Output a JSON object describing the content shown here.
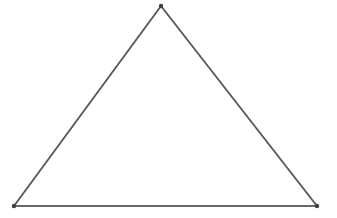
{
  "figure": {
    "kind": "geometry-diagram",
    "shape_name": "triangle",
    "caption": "",
    "background_color": "#ffffff",
    "canvas": {
      "width": 337,
      "height": 218
    },
    "stroke": {
      "color": "#5a5a5a",
      "width": 1.5,
      "opacity": 0.92
    },
    "vertex_marker": {
      "color": "#3f3f3f",
      "radius": 2.2,
      "shown": true
    },
    "vertices": [
      {
        "name": "apex",
        "label": "",
        "x": 161,
        "y": 6
      },
      {
        "name": "bottom-left",
        "label": "",
        "x": 14,
        "y": 206
      },
      {
        "name": "bottom-right",
        "label": "",
        "x": 317,
        "y": 206
      }
    ],
    "edges": [
      {
        "name": "left-edge",
        "from": "bottom-left",
        "to": "apex"
      },
      {
        "name": "right-edge",
        "from": "apex",
        "to": "bottom-right"
      },
      {
        "name": "base-edge",
        "from": "bottom-right",
        "to": "bottom-left"
      }
    ],
    "polygon_points": "161,6 317,206 14,206"
  }
}
